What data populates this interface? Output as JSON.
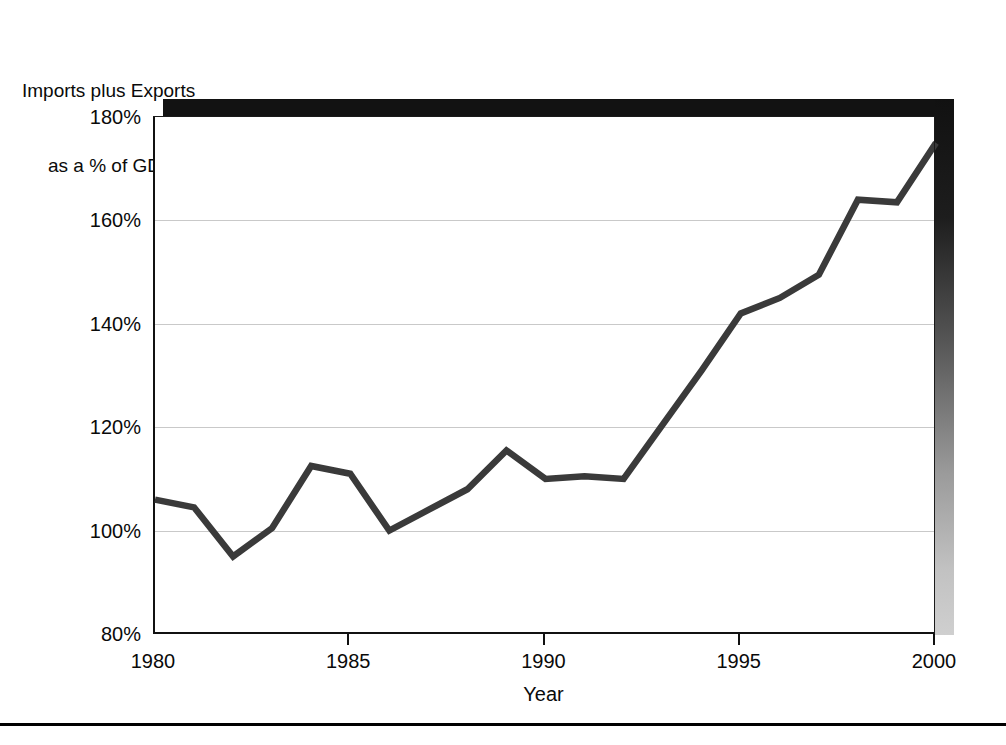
{
  "figure": {
    "y_caption_line1": "Imports plus Exports",
    "y_caption_line2": "as a % of GDP",
    "x_axis_title": "Year",
    "line_color": "#3a3a3a",
    "grid_color": "#c9c9c9",
    "frame_color": "#111111"
  },
  "axes": {
    "y_tick_labels": [
      "180%",
      "160%",
      "140%",
      "120%",
      "100%",
      "80%"
    ],
    "x_tick_labels": [
      "1980",
      "1985",
      "1990",
      "1995",
      "2000"
    ]
  },
  "chart_data": {
    "type": "line",
    "title": "",
    "xlabel": "Year",
    "ylabel": "Imports plus Exports as a % of GDP",
    "xlim": [
      1980,
      2000
    ],
    "ylim": [
      80,
      180
    ],
    "yticks": [
      80,
      100,
      120,
      140,
      160,
      180
    ],
    "xticks": [
      1980,
      1985,
      1990,
      1995,
      2000
    ],
    "ytick_labels": [
      "80%",
      "100%",
      "120%",
      "140%",
      "160%",
      "180%"
    ],
    "grid": "horizontal",
    "legend": "none",
    "x": [
      1980,
      1981,
      1982,
      1983,
      1984,
      1985,
      1986,
      1987,
      1988,
      1989,
      1990,
      1991,
      1992,
      1993,
      1994,
      1995,
      1996,
      1997,
      1998,
      1999,
      2000
    ],
    "values": [
      106,
      104.5,
      95,
      100.5,
      112.5,
      111,
      100,
      104,
      108,
      115.5,
      110,
      110.5,
      110,
      120.5,
      131,
      142,
      145,
      149.5,
      164,
      163.5,
      175
    ],
    "series": [
      {
        "name": "Imports plus Exports as a % of GDP",
        "values": [
          106,
          104.5,
          95,
          100.5,
          112.5,
          111,
          100,
          104,
          108,
          115.5,
          110,
          110.5,
          110,
          120.5,
          131,
          142,
          145,
          149.5,
          164,
          163.5,
          175
        ]
      }
    ]
  }
}
